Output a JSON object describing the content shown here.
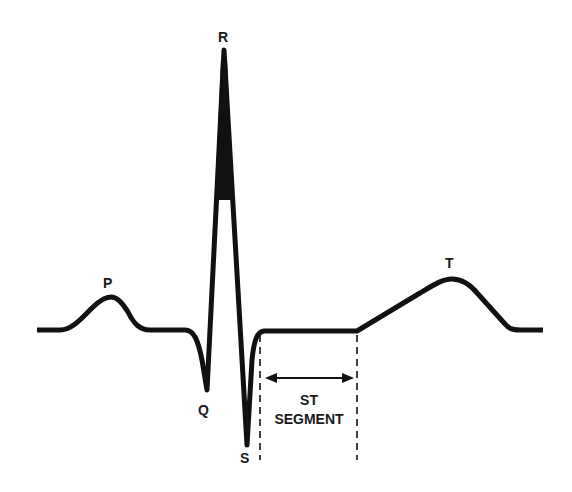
{
  "diagram": {
    "type": "ecg-waveform",
    "colors": {
      "trace": "#111111",
      "background": "#ffffff",
      "text": "#1a1a1a"
    },
    "labels": {
      "p": "P",
      "q": "Q",
      "r": "R",
      "s": "S",
      "t": "T",
      "st_line1": "ST",
      "st_line2": "SEGMENT"
    }
  }
}
